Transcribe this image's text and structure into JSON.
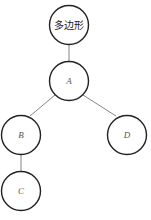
{
  "diagram": {
    "type": "tree",
    "nodes": [
      {
        "id": "root",
        "label": "多边形"
      },
      {
        "id": "A",
        "label": "A"
      },
      {
        "id": "B",
        "label": "B"
      },
      {
        "id": "D",
        "label": "D"
      },
      {
        "id": "C",
        "label": "C"
      }
    ],
    "edges": [
      {
        "from": "root",
        "to": "A"
      },
      {
        "from": "A",
        "to": "B"
      },
      {
        "from": "A",
        "to": "D"
      },
      {
        "from": "B",
        "to": "C"
      }
    ]
  }
}
